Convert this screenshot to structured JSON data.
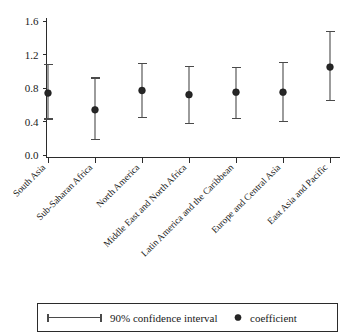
{
  "chart_data": {
    "type": "scatter",
    "title": "",
    "subtitle": "",
    "xlabel": "",
    "ylabel": "",
    "ylim": [
      0.0,
      1.7
    ],
    "yticks": [
      0.0,
      0.4,
      0.8,
      1.2,
      1.6
    ],
    "ytick_labels": [
      "0.0",
      "0.4",
      "0.8",
      "1.2",
      "1.6"
    ],
    "grid": false,
    "legend_position": "below-axes",
    "categories": [
      "South Asia",
      "Sub-Saharan Africa",
      "North America",
      "Middle East and North Africa",
      "Latin America and the Caribbean",
      "Europe and Central Asia",
      "East Asia and Pacific"
    ],
    "series": [
      {
        "name": "coefficient",
        "values": [
          0.74,
          0.54,
          0.77,
          0.72,
          0.75,
          0.75,
          1.05
        ]
      },
      {
        "name": "90% confidence interval lower",
        "values": [
          0.43,
          0.19,
          0.45,
          0.38,
          0.44,
          0.4,
          0.65
        ]
      },
      {
        "name": "90% confidence interval upper",
        "values": [
          1.08,
          0.92,
          1.09,
          1.06,
          1.05,
          1.1,
          1.47
        ]
      }
    ],
    "points": [
      {
        "category": "South Asia",
        "coefficient": 0.74,
        "ci_low": 0.43,
        "ci_high": 1.08
      },
      {
        "category": "Sub-Saharan Africa",
        "coefficient": 0.54,
        "ci_low": 0.19,
        "ci_high": 0.92
      },
      {
        "category": "North America",
        "coefficient": 0.77,
        "ci_low": 0.45,
        "ci_high": 1.09
      },
      {
        "category": "Middle East and North Africa",
        "coefficient": 0.72,
        "ci_low": 0.38,
        "ci_high": 1.06
      },
      {
        "category": "Latin America and the Caribbean",
        "coefficient": 0.75,
        "ci_low": 0.44,
        "ci_high": 1.05
      },
      {
        "category": "Europe and Central Asia",
        "coefficient": 0.75,
        "ci_low": 0.4,
        "ci_high": 1.1
      },
      {
        "category": "East Asia and Pacific",
        "coefficient": 1.05,
        "ci_low": 0.65,
        "ci_high": 1.47
      }
    ]
  },
  "legend": {
    "interval_label": "90% confidence interval",
    "coefficient_label": "coefficient"
  },
  "colors": {
    "axis": "#2b2b2b",
    "marker": "#262626",
    "interval": "#4a4a4a",
    "background": "#ffffff"
  }
}
